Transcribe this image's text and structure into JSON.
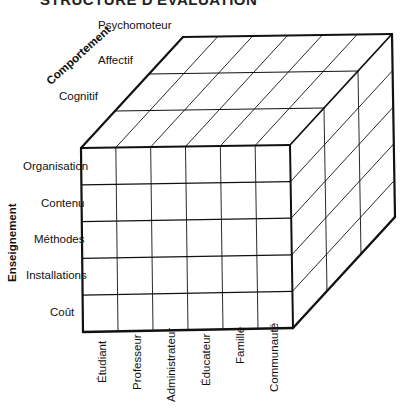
{
  "title": "STRUCTURE D'ÉVALUATION",
  "axes": {
    "behavior": {
      "label": "Comportement",
      "items": [
        "Psychomoteur",
        "Affectif",
        "Cognitif"
      ]
    },
    "teaching": {
      "label": "Enseignement",
      "items": [
        "Organisation",
        "Contenu",
        "Méthodes",
        "Installations",
        "Coût"
      ]
    },
    "audience": {
      "items": [
        "Étudiant",
        "Professeur",
        "Administrateur",
        "Éducateur",
        "Famille",
        "Communauté"
      ]
    }
  },
  "colors": {
    "line": "#111111",
    "background": "#ffffff"
  }
}
